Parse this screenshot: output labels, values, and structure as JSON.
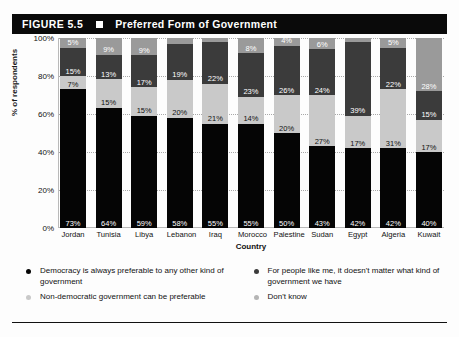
{
  "figure": {
    "number": "FIGURE 5.5",
    "marker": "black-square",
    "title": "Preferred Form of Government"
  },
  "chart_data": {
    "type": "bar",
    "subtype": "stacked-bar-100-percent",
    "title": "Preferred Form of Government",
    "xlabel": "Country",
    "ylabel": "% of respondents",
    "ylim": [
      0,
      100
    ],
    "yticks": [
      "0%",
      "20%",
      "40%",
      "60%",
      "80%",
      "100%"
    ],
    "grid": true,
    "legend_position": "bottom",
    "categories": [
      "Jordan",
      "Tunisia",
      "Libya",
      "Lebanon",
      "Iraq",
      "Morocco",
      "Palestine",
      "Sudan",
      "Egypt",
      "Algeria",
      "Kuwait"
    ],
    "series": [
      {
        "name": "Democracy is always preferable to any other kind of government",
        "color": "#050505",
        "values": [
          73,
          64,
          59,
          58,
          55,
          55,
          50,
          43,
          42,
          42,
          40
        ],
        "labels": [
          "73%",
          "64%",
          "59%",
          "58%",
          "55%",
          "55%",
          "50%",
          "43%",
          "42%",
          "42%",
          "40%"
        ]
      },
      {
        "name": "Non-democratic government can be preferable",
        "color": "#c9c9c9",
        "values": [
          7,
          15,
          15,
          20,
          21,
          14,
          20,
          27,
          17,
          31,
          17
        ],
        "labels": [
          "7%",
          "15%",
          "15%",
          "20%",
          "21%",
          "14%",
          "20%",
          "27%",
          "17%",
          "31%",
          "17%"
        ]
      },
      {
        "name": "For people like me, it doesn't matter what kind of government we have",
        "color": "#3b3b3b",
        "values": [
          15,
          13,
          17,
          19,
          22,
          23,
          26,
          24,
          39,
          22,
          15
        ],
        "labels": [
          "15%",
          "13%",
          "17%",
          "19%",
          "22%",
          "23%",
          "26%",
          "24%",
          "39%",
          "22%",
          "15%"
        ]
      },
      {
        "name": "Don't know",
        "color": "#9a9a9a",
        "values": [
          5,
          9,
          9,
          3,
          2,
          8,
          4,
          6,
          2,
          5,
          28
        ],
        "labels": [
          "5%",
          "9%",
          "9%",
          "",
          "",
          "8%",
          "4%",
          "6%",
          "",
          "5%",
          "28%"
        ]
      }
    ]
  },
  "legend": {
    "left": [
      {
        "label": "Democracy is always preferable to any other kind of government",
        "swatch": "#050505"
      },
      {
        "label": "Non-democratic government can be preferable",
        "swatch": "#c9c9c9"
      }
    ],
    "right": [
      {
        "label": "For people like me, it doesn't matter what kind of government we have",
        "swatch": "#3b3b3b"
      },
      {
        "label": "Don't know",
        "swatch": "#b5b5b5"
      }
    ]
  }
}
